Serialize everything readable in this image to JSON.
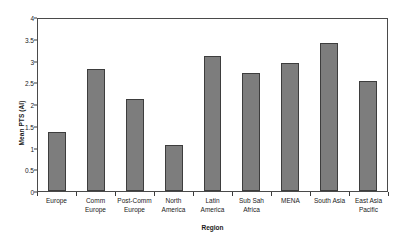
{
  "chart_data": {
    "type": "bar",
    "title": "",
    "xlabel": "Region",
    "ylabel": "Mean PTS (AI)",
    "categories": [
      "Europe",
      "Comm Europe",
      "Post-Comm Europe",
      "North America",
      "Latin America",
      "Sub Sah Africa",
      "MENA",
      "South Asia",
      "East Asia Pacific"
    ],
    "category_lines": [
      [
        "Europe"
      ],
      [
        "Comm",
        "Europe"
      ],
      [
        "Post-Comm",
        "Europe"
      ],
      [
        "North",
        "America"
      ],
      [
        "Latin",
        "America"
      ],
      [
        "Sub Sah",
        "Africa"
      ],
      [
        "MENA"
      ],
      [
        "South Asia"
      ],
      [
        "East Asia",
        "Pacific"
      ]
    ],
    "values": [
      1.38,
      2.83,
      2.15,
      1.06,
      3.13,
      2.74,
      2.98,
      3.45,
      2.57
    ],
    "ylim": [
      0,
      4
    ],
    "ytick_values": [
      0,
      0.5,
      1,
      1.5,
      2,
      2.5,
      3,
      3.5,
      4
    ],
    "ytick_labels": [
      "0",
      "0.5",
      "1",
      "1.5",
      "2",
      "2.5",
      "3",
      "3.5",
      "4"
    ],
    "grid": false,
    "legend": false,
    "bar_color": "#7d7d7d",
    "bar_edge_color": "#3d3d3d",
    "frame_color": "#4a4a4a",
    "background_color": "#ffffff"
  }
}
